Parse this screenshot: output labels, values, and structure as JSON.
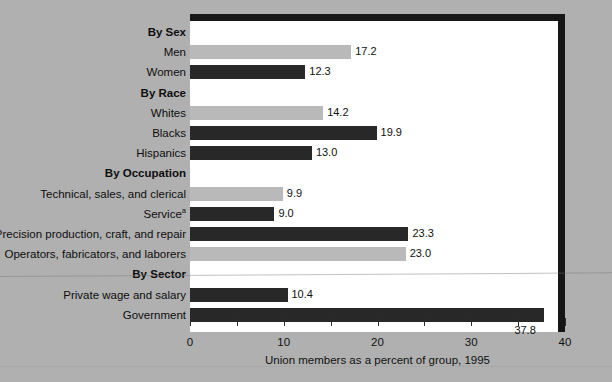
{
  "chart_data": {
    "type": "bar",
    "orientation": "horizontal",
    "title": "",
    "xlabel": "Union members as a percent of group, 1995",
    "ylabel": "",
    "xlim": [
      0,
      40
    ],
    "xticks": [
      0,
      5,
      10,
      15,
      20,
      25,
      30,
      35,
      40
    ],
    "xtick_labels": [
      "0",
      "",
      "10",
      "",
      "20",
      "",
      "30",
      "",
      "40"
    ],
    "grid": false,
    "legend": null,
    "colors": {
      "light_bar": "#b9b9b9",
      "dark_bar": "#282828",
      "background": "#b0b0b0",
      "plot_background": "#ffffff",
      "frame": "#161616"
    },
    "categories": [
      "By Sex",
      "Men",
      "Women",
      "By Race",
      "Whites",
      "Blacks",
      "Hispanics",
      "By Occupation",
      "Technical, sales, and clerical",
      "Service",
      "Precision production, craft, and repair",
      "Operators, fabricators, and laborers",
      "By Sector",
      "Private wage and salary",
      "Government"
    ],
    "values": [
      null,
      17.2,
      12.3,
      null,
      14.2,
      19.9,
      13.0,
      null,
      9.9,
      9.0,
      23.3,
      23.0,
      null,
      10.4,
      37.8
    ],
    "items": [
      {
        "label": "By Sex",
        "is_group": true,
        "value": null,
        "value_text": "",
        "color": null
      },
      {
        "label": "Men",
        "is_group": false,
        "value": 17.2,
        "value_text": "17.2",
        "color": "light"
      },
      {
        "label": "Women",
        "is_group": false,
        "value": 12.3,
        "value_text": "12.3",
        "color": "dark"
      },
      {
        "label": "By Race",
        "is_group": true,
        "value": null,
        "value_text": "",
        "color": null
      },
      {
        "label": "Whites",
        "is_group": false,
        "value": 14.2,
        "value_text": "14.2",
        "color": "light"
      },
      {
        "label": "Blacks",
        "is_group": false,
        "value": 19.9,
        "value_text": "19.9",
        "color": "dark"
      },
      {
        "label": "Hispanics",
        "is_group": false,
        "value": 13.0,
        "value_text": "13.0",
        "color": "dark"
      },
      {
        "label": "By Occupation",
        "is_group": true,
        "value": null,
        "value_text": "",
        "color": null
      },
      {
        "label": "Technical, sales, and clerical",
        "is_group": false,
        "value": 9.9,
        "value_text": "9.9",
        "color": "light"
      },
      {
        "label": "Service",
        "footnote": "a",
        "is_group": false,
        "value": 9.0,
        "value_text": "9.0",
        "color": "dark"
      },
      {
        "label": "Precision production, craft, and repair",
        "is_group": false,
        "value": 23.3,
        "value_text": "23.3",
        "color": "dark"
      },
      {
        "label": "Operators, fabricators, and laborers",
        "is_group": false,
        "value": 23.0,
        "value_text": "23.0",
        "color": "light"
      },
      {
        "label": "By Sector",
        "is_group": true,
        "value": null,
        "value_text": "",
        "color": null
      },
      {
        "label": "Private wage and salary",
        "is_group": false,
        "value": 10.4,
        "value_text": "10.4",
        "color": "dark"
      },
      {
        "label": "Government",
        "is_group": false,
        "value": 37.8,
        "value_text": "37.8",
        "color": "dark",
        "value_below": true
      }
    ]
  }
}
